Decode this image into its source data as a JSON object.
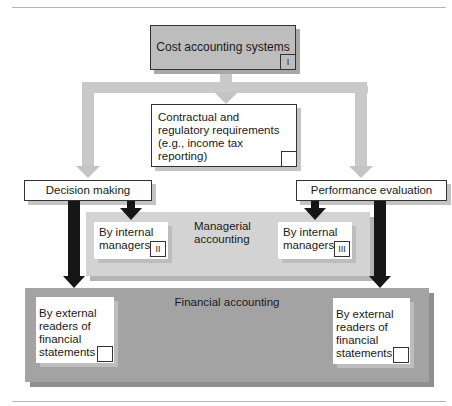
{
  "diagram": {
    "top": {
      "label": "Cost accounting systems",
      "num": "I",
      "fill": "#bdbdbd"
    },
    "contractual": {
      "lines": [
        "Contractual and",
        "regulatory requirements",
        "(e.g., income tax",
        "reporting)"
      ],
      "num": ""
    },
    "decision": {
      "label": "Decision making"
    },
    "performance": {
      "label": "Performance evaluation"
    },
    "managerial": {
      "lines": [
        "Managerial",
        "accounting"
      ],
      "fill": "#d3d3d3",
      "left_box": {
        "lines": [
          "By internal",
          "managers"
        ],
        "num": "II"
      },
      "right_box": {
        "lines": [
          "By internal",
          "managers"
        ],
        "num": "III"
      }
    },
    "financial": {
      "label": "Financial accounting",
      "fill": "#a3a3a3",
      "left_box": {
        "lines": [
          "By external",
          "readers of",
          "financial",
          "statements"
        ],
        "num": ""
      },
      "right_box": {
        "lines": [
          "By external",
          "readers of",
          "financial",
          "statements"
        ],
        "num": ""
      }
    },
    "colors": {
      "light_arrow": "#c4c4c4",
      "dark_arrow": "#161616",
      "rule": "#b5b5b5"
    }
  }
}
